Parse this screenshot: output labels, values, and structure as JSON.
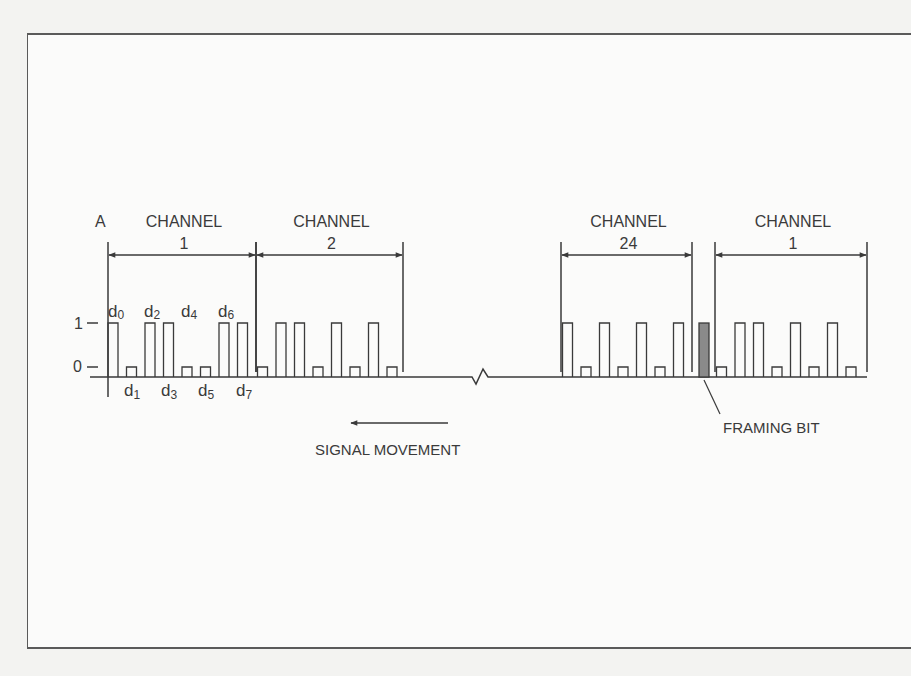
{
  "figure": {
    "point_label": "A",
    "level_high_label": "1",
    "level_low_label": "0",
    "channels": [
      {
        "id": "ch1",
        "title": "CHANNEL",
        "number": "1",
        "x_start": 108,
        "x_end": 256,
        "bits": [
          1,
          0,
          1,
          1,
          0,
          0,
          1,
          1
        ]
      },
      {
        "id": "ch2",
        "title": "CHANNEL",
        "number": "2",
        "x_start": 256,
        "x_end": 403,
        "bits": [
          0,
          1,
          1,
          0,
          1,
          0,
          1,
          0
        ]
      },
      {
        "id": "ch24",
        "title": "CHANNEL",
        "number": "24",
        "x_start": 561,
        "x_end": 692,
        "bits": [
          1,
          0,
          1,
          0,
          1,
          0,
          1
        ]
      },
      {
        "id": "ch1-next",
        "title": "CHANNEL",
        "number": "1",
        "x_start": 715,
        "x_end": 867,
        "bits": [
          0,
          1,
          1,
          0,
          1,
          0,
          1,
          0
        ]
      }
    ],
    "bit_labels_top": [
      {
        "base": "d",
        "sub": "0"
      },
      {
        "base": "d",
        "sub": "2"
      },
      {
        "base": "d",
        "sub": "4"
      },
      {
        "base": "d",
        "sub": "6"
      }
    ],
    "bit_labels_bottom": [
      {
        "base": "d",
        "sub": "1"
      },
      {
        "base": "d",
        "sub": "3"
      },
      {
        "base": "d",
        "sub": "5"
      },
      {
        "base": "d",
        "sub": "7"
      }
    ],
    "framing_bit_label": "FRAMING BIT",
    "signal_movement_label": "SIGNAL MOVEMENT",
    "colors": {
      "line": "#3a3a3a",
      "framing_bit_fill": "#8a8a8a",
      "background": "#fbfbfa"
    }
  }
}
